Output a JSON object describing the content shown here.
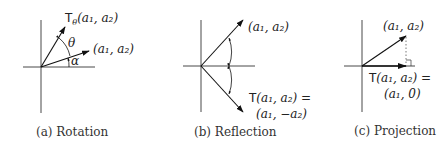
{
  "figure": {
    "panels": [
      {
        "id": "a",
        "caption": "(a) Rotation",
        "labels": {
          "rotated_vector": "Tθ(a1, a2)",
          "rotated_T": "T",
          "rotated_sub": "θ",
          "rotated_args": "(a₁, a₂)",
          "original_vector": "(a₁, a₂)",
          "angle_theta": "θ",
          "angle_alpha": "α"
        }
      },
      {
        "id": "b",
        "caption": "(b) Reflection",
        "labels": {
          "original_vector": "(a₁, a₂)",
          "image_line1": "T(a₁, a₂) =",
          "image_line2": "(a₁, −a₂)"
        }
      },
      {
        "id": "c",
        "caption": "(c) Projection",
        "labels": {
          "original_vector": "(a₁, a₂)",
          "image_line1": "T(a₁, a₂) =",
          "image_line2": "(a₁, 0)"
        }
      }
    ]
  }
}
